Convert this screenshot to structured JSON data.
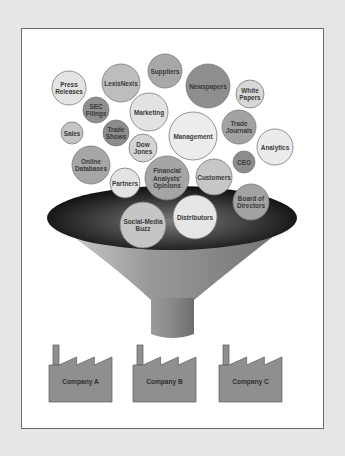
{
  "diagram": {
    "type": "information-funnel",
    "colors": {
      "page_background": "#e6e6e6",
      "frame_background": "#ffffff",
      "frame_border": "#6b6b6b",
      "bubble_stroke": "#7a7a7a",
      "funnel_rim_dark": "#0a0a0a",
      "funnel_body_light": "#cfcfcf",
      "funnel_body_mid": "#8a8a8a",
      "factory_fill": "#8f8f8f",
      "factory_stroke": "#5a5a5a"
    },
    "bubbles": [
      {
        "id": "press-releases",
        "lines": [
          "Press",
          "Releases"
        ],
        "cx": 69,
        "cy": 88,
        "r": 17,
        "fill": "#e4e4e4"
      },
      {
        "id": "lexisnexis",
        "lines": [
          "LexisNexis"
        ],
        "cx": 121,
        "cy": 83,
        "r": 19,
        "fill": "#bdbdbd"
      },
      {
        "id": "suppliers",
        "lines": [
          "Suppliers"
        ],
        "cx": 165,
        "cy": 71,
        "r": 17,
        "fill": "#a8a8a8"
      },
      {
        "id": "newspapers",
        "lines": [
          "Newspapers"
        ],
        "cx": 208,
        "cy": 86,
        "r": 22,
        "fill": "#8e8e8e"
      },
      {
        "id": "white-papers",
        "lines": [
          "White",
          "Papers"
        ],
        "cx": 250,
        "cy": 94,
        "r": 14,
        "fill": "#d7d7d7"
      },
      {
        "id": "sec-filings",
        "lines": [
          "SEC",
          "Filings"
        ],
        "cx": 96,
        "cy": 110,
        "r": 13,
        "fill": "#8f8f8f"
      },
      {
        "id": "marketing",
        "lines": [
          "Marketing"
        ],
        "cx": 149,
        "cy": 112,
        "r": 19,
        "fill": "#e2e2e2"
      },
      {
        "id": "sales",
        "lines": [
          "Sales"
        ],
        "cx": 72,
        "cy": 133,
        "r": 11,
        "fill": "#c4c4c4"
      },
      {
        "id": "trade-shows",
        "lines": [
          "Trade",
          "Shows"
        ],
        "cx": 116,
        "cy": 133,
        "r": 13,
        "fill": "#8c8c8c"
      },
      {
        "id": "management",
        "lines": [
          "Management"
        ],
        "cx": 193,
        "cy": 136,
        "r": 24,
        "fill": "#ececec"
      },
      {
        "id": "trade-journals",
        "lines": [
          "Trade",
          "Journals"
        ],
        "cx": 239,
        "cy": 127,
        "r": 17,
        "fill": "#a3a3a3"
      },
      {
        "id": "analytics",
        "lines": [
          "Analytics"
        ],
        "cx": 275,
        "cy": 147,
        "r": 18,
        "fill": "#ebebeb"
      },
      {
        "id": "dow-jones",
        "lines": [
          "Dow",
          "Jones"
        ],
        "cx": 143,
        "cy": 148,
        "r": 14,
        "fill": "#d4d4d4"
      },
      {
        "id": "online-databases",
        "lines": [
          "Online",
          "Databases"
        ],
        "cx": 91,
        "cy": 165,
        "r": 19,
        "fill": "#a6a6a6"
      },
      {
        "id": "ceo",
        "lines": [
          "CEO"
        ],
        "cx": 244,
        "cy": 162,
        "r": 11,
        "fill": "#8c8c8c"
      },
      {
        "id": "partners",
        "lines": [
          "Partners"
        ],
        "cx": 125,
        "cy": 183,
        "r": 15,
        "fill": "#e3e3e3"
      },
      {
        "id": "financial-analysts-opinions",
        "lines": [
          "Financial",
          "Analysts'",
          "Opinions"
        ],
        "cx": 167,
        "cy": 178,
        "r": 22,
        "fill": "#a5a5a5"
      },
      {
        "id": "customers",
        "lines": [
          "Customers"
        ],
        "cx": 214,
        "cy": 177,
        "r": 18,
        "fill": "#c7c7c7"
      },
      {
        "id": "board-of-directors",
        "lines": [
          "Board of",
          "Directors"
        ],
        "cx": 251,
        "cy": 202,
        "r": 18,
        "fill": "#a2a2a2"
      },
      {
        "id": "social-media-buzz",
        "lines": [
          "Social-Media",
          "Buzz"
        ],
        "cx": 143,
        "cy": 225,
        "r": 23,
        "fill": "#c5c5c5"
      },
      {
        "id": "distributors",
        "lines": [
          "Distributors"
        ],
        "cx": 195,
        "cy": 217,
        "r": 22,
        "fill": "#e6e6e6"
      }
    ],
    "funnel": {
      "rim": {
        "cx": 172,
        "cy": 218,
        "rx": 125,
        "ry": 32
      },
      "stem": {
        "x": 151,
        "y": 300,
        "width": 43,
        "height": 40
      }
    },
    "factories": [
      {
        "id": "company-a",
        "label": "Company A",
        "x": 49,
        "y": 345,
        "width": 63,
        "height": 57
      },
      {
        "id": "company-b",
        "label": "Company B",
        "x": 133,
        "y": 345,
        "width": 63,
        "height": 57
      },
      {
        "id": "company-c",
        "label": "Company C",
        "x": 219,
        "y": 345,
        "width": 63,
        "height": 57
      }
    ]
  }
}
